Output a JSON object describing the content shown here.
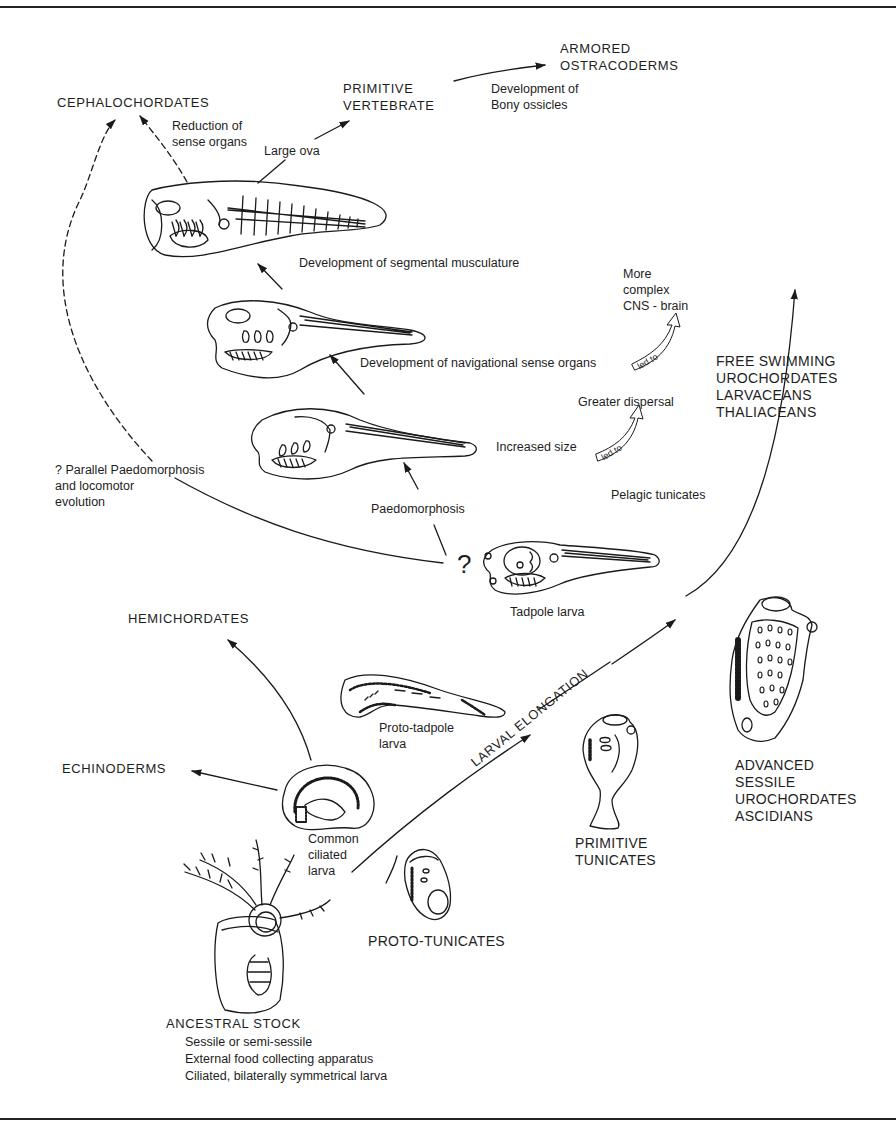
{
  "diagram": {
    "groups": {
      "cephalochordates": "CEPHALOCHORDATES",
      "primitive_vertebrate": [
        "PRIMITIVE",
        "VERTEBRATE"
      ],
      "armored_ostracoderms": [
        "ARMORED",
        "OSTRACODERMS"
      ],
      "free_swimming": [
        "FREE SWIMMING",
        "UROCHORDATES",
        "LARVACEANS",
        "THALIACEANS"
      ],
      "hemichordates": "HEMICHORDATES",
      "echinoderms": "ECHINODERMS",
      "advanced_sessile": [
        "ADVANCED",
        "SESSILE",
        "UROCHORDATES",
        "ASCIDIANS"
      ],
      "primitive_tunicates": [
        "PRIMITIVE",
        "TUNICATES"
      ],
      "proto_tunicates": "PROTO-TUNICATES",
      "ancestral_stock": "ANCESTRAL STOCK"
    },
    "ancestral_traits": [
      "Sessile or semi-sessile",
      "External food collecting apparatus",
      "Ciliated, bilaterally symmetrical larva"
    ],
    "annotations": {
      "reduction_sense": [
        "Reduction of",
        "sense organs"
      ],
      "large_ova": "Large ova",
      "bony_ossicles": [
        "Development of",
        "Bony ossicles"
      ],
      "segmental": "Development of segmental musculature",
      "navigational": "Development of navigational sense organs",
      "complex_cns": [
        "More",
        "complex",
        "CNS - brain"
      ],
      "greater_dispersal": "Greater dispersal",
      "increased_size": "Increased size",
      "led_to": "led to",
      "parallel": [
        "? Parallel Paedomorphosis",
        "and locomotor",
        "evolution"
      ],
      "paedomorphosis": "Paedomorphosis",
      "pelagic": "Pelagic tunicates",
      "question": "?",
      "tadpole_larva": "Tadpole larva",
      "proto_tadpole": [
        "Proto-tadpole",
        "larva"
      ],
      "common_ciliated": [
        "Common",
        "ciliated",
        "larva"
      ],
      "larval_elongation": "LARVAL ELONGATION"
    }
  }
}
